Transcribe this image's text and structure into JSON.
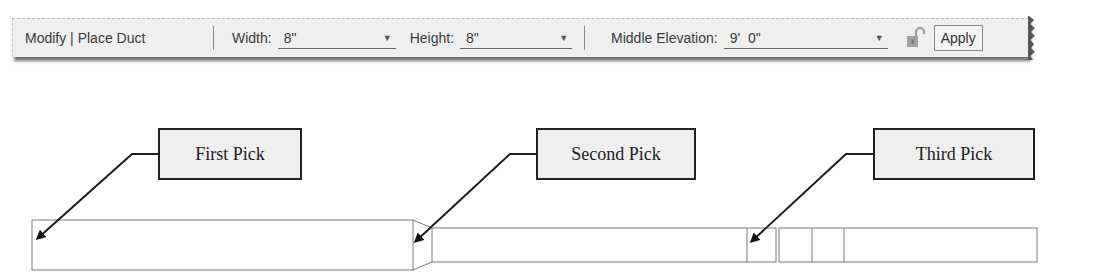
{
  "toolbar": {
    "title": "Modify | Place Duct",
    "width": {
      "label": "Width:",
      "value": "8\""
    },
    "height": {
      "label": "Height:",
      "value": "8\""
    },
    "middle_elevation": {
      "label": "Middle Elevation:",
      "value": "9'  0\""
    },
    "lock_icon": "unlocked-padlock",
    "apply_label": "Apply"
  },
  "callouts": [
    {
      "label": "First Pick"
    },
    {
      "label": "Second Pick"
    },
    {
      "label": "Third Pick"
    }
  ],
  "colors": {
    "toolbar_bg": "#efefef",
    "callout_bg": "#efefef",
    "callout_border": "#222222",
    "duct_stroke": "#7a7a7a",
    "lock_color": "#9a9a9a"
  }
}
